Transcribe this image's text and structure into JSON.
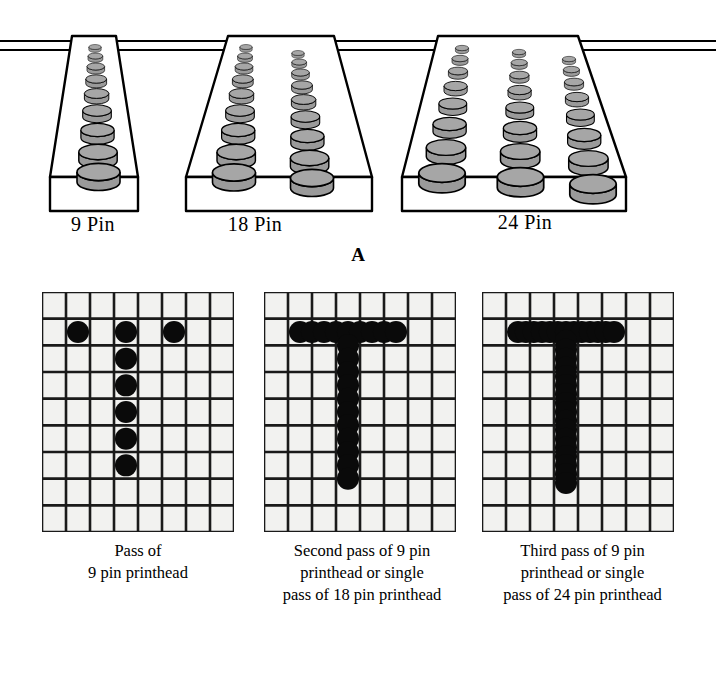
{
  "figure": {
    "panels": [
      {
        "letter": "A",
        "name": "printhead-pin-configurations",
        "heads": [
          {
            "label": "9 Pin",
            "columns": 1,
            "pins_per_column": 9,
            "total_pins": 9
          },
          {
            "label": "18 Pin",
            "columns": 2,
            "pins_per_column": 9,
            "total_pins": 18
          },
          {
            "label": "24 Pin",
            "columns": 3,
            "pins_per_column": 8,
            "total_pins": 24
          }
        ]
      },
      {
        "letter": "B",
        "name": "printed-character-quality",
        "grids": [
          {
            "caption": "Pass of\n9 pin printhead",
            "name": "grid-single-pass",
            "cols": 8,
            "rows": 9,
            "dot_style": "discrete",
            "dots": [
              [
                1,
                1
              ],
              [
                3,
                1
              ],
              [
                5,
                1
              ],
              [
                3,
                2
              ],
              [
                3,
                3
              ],
              [
                3,
                4
              ],
              [
                3,
                5
              ],
              [
                3,
                6
              ]
            ]
          },
          {
            "caption": "Second pass of 9 pin\nprinthead or single\npass of 18 pin printhead",
            "name": "grid-double-pass",
            "cols": 8,
            "rows": 9,
            "dot_style": "overlapping-scalloped",
            "dots": [
              [
                1,
                1
              ],
              [
                1.5,
                1
              ],
              [
                2,
                1
              ],
              [
                2.5,
                1
              ],
              [
                3,
                1
              ],
              [
                3.5,
                1
              ],
              [
                4,
                1
              ],
              [
                4.5,
                1
              ],
              [
                5,
                1
              ],
              [
                3,
                1.5
              ],
              [
                3,
                2
              ],
              [
                3,
                2.5
              ],
              [
                3,
                3
              ],
              [
                3,
                3.5
              ],
              [
                3,
                4
              ],
              [
                3,
                4.5
              ],
              [
                3,
                5
              ],
              [
                3,
                5.5
              ],
              [
                3,
                6
              ],
              [
                3,
                6.5
              ]
            ]
          },
          {
            "caption": "Third pass of 9 pin\nprinthead or single\npass of 24 pin printhead",
            "name": "grid-triple-pass",
            "cols": 8,
            "rows": 9,
            "dot_style": "overlapping-smooth",
            "dots": [
              [
                1,
                1
              ],
              [
                1.33,
                1
              ],
              [
                1.66,
                1
              ],
              [
                2,
                1
              ],
              [
                2.33,
                1
              ],
              [
                2.66,
                1
              ],
              [
                3,
                1
              ],
              [
                3.33,
                1
              ],
              [
                3.66,
                1
              ],
              [
                4,
                1
              ],
              [
                4.33,
                1
              ],
              [
                4.66,
                1
              ],
              [
                5,
                1
              ],
              [
                3,
                1.33
              ],
              [
                3,
                1.66
              ],
              [
                3,
                2
              ],
              [
                3,
                2.33
              ],
              [
                3,
                2.66
              ],
              [
                3,
                3
              ],
              [
                3,
                3.33
              ],
              [
                3,
                3.66
              ],
              [
                3,
                4
              ],
              [
                3,
                4.33
              ],
              [
                3,
                4.66
              ],
              [
                3,
                5
              ],
              [
                3,
                5.33
              ],
              [
                3,
                5.66
              ],
              [
                3,
                6
              ],
              [
                3,
                6.33
              ],
              [
                3,
                6.66
              ]
            ]
          }
        ]
      }
    ],
    "colors": {
      "pin_fill": "#9a9a9a",
      "pin_top": "#a6a6a6",
      "outline": "#000000",
      "dot": "#0a0a0a",
      "grid_line": "#1a1a1a",
      "grid_cell": "#f2f2f0",
      "body_fill": "#ffffff",
      "background": "#ffffff"
    }
  }
}
